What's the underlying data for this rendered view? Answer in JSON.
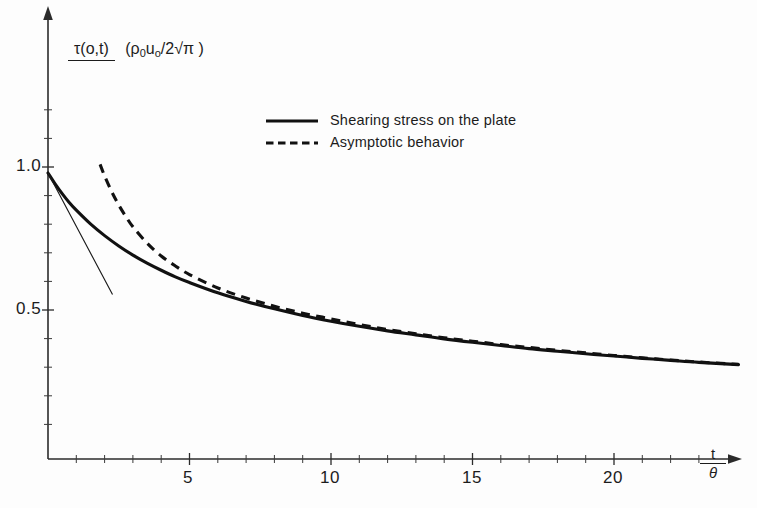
{
  "figure": {
    "background_color": "#fdfdfd",
    "ink_color": "#111111"
  },
  "axes": {
    "y_label_numerator": "τ(o,t)",
    "y_label_denominator_open": "(",
    "y_label_rho": "ρ",
    "y_label_rho_sub": "0",
    "y_label_u": "u",
    "y_label_u_sub": "o",
    "y_label_rest": "/2√π )",
    "x_label_numerator": "t",
    "x_label_denominator": "θ",
    "y_ticks": [
      "1.0",
      "0.5"
    ],
    "x_ticks": [
      "5",
      "10",
      "15",
      "20"
    ]
  },
  "legend": {
    "entries": [
      {
        "label": "Shearing stress on the plate",
        "style": "solid"
      },
      {
        "label": "Asymptotic behavior",
        "style": "dashed"
      }
    ]
  },
  "chart_data": {
    "type": "line",
    "title": "",
    "xlabel": "t/θ",
    "ylabel": "τ(o,t)/(ρ₀u₀/2√π)",
    "xlim": [
      0,
      24.5
    ],
    "ylim": [
      0,
      1.22
    ],
    "xticks": [
      5,
      10,
      15,
      20
    ],
    "yticks": [
      0.5,
      1.0
    ],
    "x_minor_tick_step": 1,
    "y_minor_tick_step": 0.1,
    "grid": false,
    "legend_position": "upper-center",
    "series": [
      {
        "name": "Shearing stress on the plate",
        "style": "solid",
        "x": [
          0,
          0.25,
          0.5,
          0.75,
          1,
          1.5,
          2,
          2.5,
          3,
          3.5,
          4,
          4.5,
          5,
          6,
          7,
          8,
          9,
          10,
          11,
          12,
          13,
          14,
          15,
          16,
          17,
          18,
          19,
          20,
          21,
          22,
          23,
          24.4
        ],
        "y": [
          1.0,
          0.962,
          0.928,
          0.897,
          0.87,
          0.822,
          0.781,
          0.745,
          0.713,
          0.685,
          0.66,
          0.637,
          0.617,
          0.581,
          0.551,
          0.525,
          0.502,
          0.482,
          0.464,
          0.448,
          0.434,
          0.42,
          0.408,
          0.397,
          0.386,
          0.377,
          0.368,
          0.36,
          0.352,
          0.345,
          0.338,
          0.33
        ]
      },
      {
        "name": "Asymptotic behavior",
        "style": "dashed",
        "x": [
          1.84,
          2,
          2.25,
          2.5,
          2.75,
          3,
          3.5,
          4,
          4.5,
          5,
          6,
          7,
          8,
          9,
          10,
          11,
          12,
          13,
          14,
          15,
          16,
          17,
          18,
          19,
          20,
          21,
          22,
          23,
          24.4
        ],
        "y": [
          1.03,
          0.99,
          0.935,
          0.888,
          0.848,
          0.812,
          0.755,
          0.71,
          0.675,
          0.645,
          0.598,
          0.563,
          0.534,
          0.51,
          0.49,
          0.47,
          0.453,
          0.438,
          0.424,
          0.412,
          0.4,
          0.39,
          0.38,
          0.371,
          0.362,
          0.354,
          0.346,
          0.339,
          0.331
        ]
      },
      {
        "name": "initial tangent",
        "style": "thin-solid",
        "x": [
          0,
          2.28
        ],
        "y": [
          1.0,
          0.575
        ]
      }
    ]
  }
}
